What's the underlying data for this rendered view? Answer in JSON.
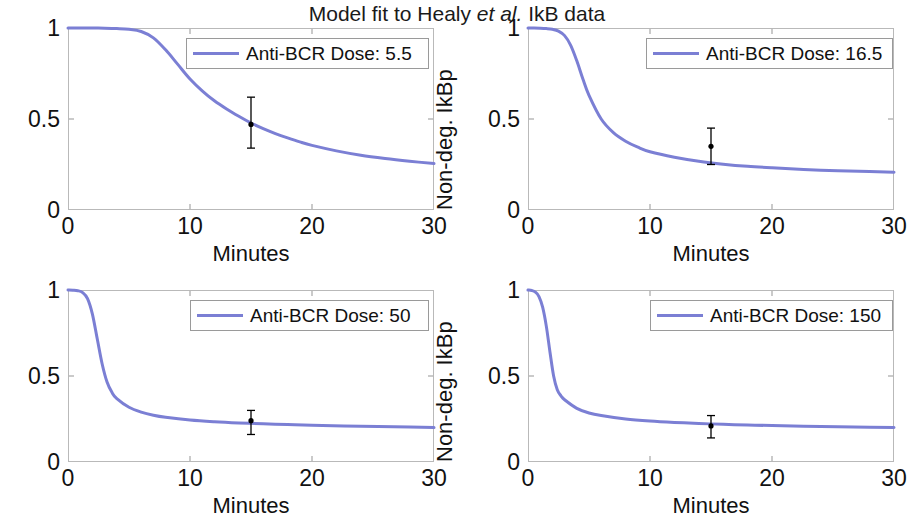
{
  "figure": {
    "title_prefix": "Model fit to Healy ",
    "title_italic": "et al.",
    "title_suffix": " IkB data",
    "title_full": "Model fit to Healy et al. IkB data",
    "line_color": "#7b7fd4",
    "axis_color": "#b9b9b9",
    "marker_color": "#000000",
    "background": "#ffffff"
  },
  "axes": {
    "xlabel": "Minutes",
    "ylabel": "Non-deg. IkBp",
    "xticks": [
      "0",
      "10",
      "20",
      "30"
    ],
    "yticks": [
      "0",
      "0.5",
      "1"
    ],
    "xlim": [
      0,
      30
    ],
    "ylim": [
      0,
      1
    ]
  },
  "panels": [
    {
      "id": "panel-dose-5-5",
      "legend_label": "Anti-BCR Dose: 5.5",
      "dose": 5.5
    },
    {
      "id": "panel-dose-16-5",
      "legend_label": "Anti-BCR Dose: 16.5",
      "dose": 16.5
    },
    {
      "id": "panel-dose-50",
      "legend_label": "Anti-BCR Dose: 50",
      "dose": 50
    },
    {
      "id": "panel-dose-150",
      "legend_label": "Anti-BCR Dose: 150",
      "dose": 150
    }
  ],
  "chart_data": {
    "type": "line",
    "title": "Model fit to Healy et al. IkB data",
    "xlabel": "Minutes",
    "ylabel": "Non-deg. IkBp",
    "xlim": [
      0,
      30
    ],
    "ylim": [
      0,
      1
    ],
    "xticks": [
      0,
      10,
      20,
      30
    ],
    "yticks": [
      0,
      0.5,
      1
    ],
    "grid": false,
    "legend_position": "top-right",
    "subplots": [
      {
        "name": "Anti-BCR Dose: 5.5",
        "dose": 5.5,
        "series": [
          {
            "name": "Model fit",
            "color": "#7b7fd4",
            "x": [
              0,
              1,
              2,
              3,
              4,
              5,
              6,
              7,
              8,
              9,
              10,
              11,
              12,
              13,
              14,
              15,
              16,
              17,
              18,
              19,
              20,
              22,
              24,
              26,
              28,
              30
            ],
            "y": [
              1.0,
              1.0,
              1.0,
              0.999,
              0.997,
              0.993,
              0.981,
              0.946,
              0.88,
              0.8,
              0.72,
              0.655,
              0.6,
              0.555,
              0.515,
              0.478,
              0.447,
              0.42,
              0.396,
              0.374,
              0.355,
              0.325,
              0.301,
              0.283,
              0.268,
              0.255
            ]
          }
        ],
        "errorbars": [
          {
            "x": 15,
            "y": 0.47,
            "lower": 0.34,
            "upper": 0.62
          }
        ]
      },
      {
        "name": "Anti-BCR Dose: 16.5",
        "dose": 16.5,
        "series": [
          {
            "name": "Model fit",
            "color": "#7b7fd4",
            "x": [
              0,
              0.5,
              1,
              1.5,
              2,
              2.5,
              3,
              3.5,
              4,
              4.5,
              5,
              6,
              7,
              8,
              9,
              10,
              12,
              14,
              16,
              18,
              20,
              24,
              28,
              30
            ],
            "y": [
              1.0,
              1.0,
              0.999,
              0.997,
              0.993,
              0.983,
              0.958,
              0.905,
              0.82,
              0.72,
              0.63,
              0.5,
              0.425,
              0.378,
              0.345,
              0.32,
              0.29,
              0.268,
              0.252,
              0.24,
              0.232,
              0.219,
              0.211,
              0.208
            ]
          }
        ],
        "errorbars": [
          {
            "x": 15,
            "y": 0.35,
            "lower": 0.25,
            "upper": 0.45
          }
        ]
      },
      {
        "name": "Anti-BCR Dose: 50",
        "dose": 50,
        "series": [
          {
            "name": "Model fit",
            "color": "#7b7fd4",
            "x": [
              0,
              0.4,
              0.8,
              1.2,
              1.6,
              2,
              2.4,
              2.8,
              3.2,
              3.6,
              4,
              5,
              6,
              7,
              8,
              10,
              12,
              14,
              16,
              18,
              20,
              24,
              28,
              30
            ],
            "y": [
              1.0,
              0.999,
              0.996,
              0.985,
              0.95,
              0.86,
              0.715,
              0.57,
              0.465,
              0.405,
              0.368,
              0.318,
              0.29,
              0.272,
              0.26,
              0.244,
              0.234,
              0.227,
              0.222,
              0.218,
              0.214,
              0.208,
              0.203,
              0.2
            ]
          }
        ],
        "errorbars": [
          {
            "x": 15,
            "y": 0.24,
            "lower": 0.16,
            "upper": 0.3
          }
        ]
      },
      {
        "name": "Anti-BCR Dose: 150",
        "dose": 150,
        "series": [
          {
            "name": "Model fit",
            "color": "#7b7fd4",
            "x": [
              0,
              0.3,
              0.6,
              0.9,
              1.2,
              1.5,
              1.8,
              2.1,
              2.4,
              2.7,
              3,
              4,
              5,
              6,
              8,
              10,
              12,
              14,
              16,
              18,
              20,
              24,
              28,
              30
            ],
            "y": [
              1.0,
              0.997,
              0.988,
              0.962,
              0.9,
              0.79,
              0.64,
              0.5,
              0.42,
              0.385,
              0.362,
              0.312,
              0.285,
              0.27,
              0.25,
              0.238,
              0.23,
              0.224,
              0.219,
              0.215,
              0.212,
              0.206,
              0.202,
              0.2
            ]
          }
        ],
        "errorbars": [
          {
            "x": 15,
            "y": 0.21,
            "lower": 0.14,
            "upper": 0.27
          }
        ]
      }
    ]
  }
}
